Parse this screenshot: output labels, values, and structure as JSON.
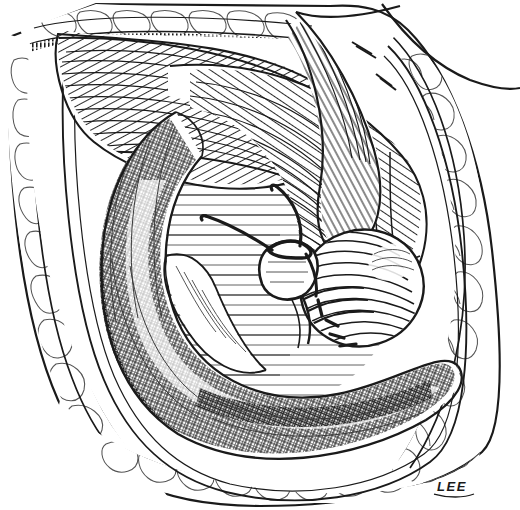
{
  "figure": {
    "medium": "pen-and-ink line drawing",
    "palette": {
      "background": "#ffffff",
      "ink": "#1a1a1a",
      "ink_soft": "#3a3a3a",
      "ink_light": "#555555"
    },
    "signature": "LEE",
    "canvas": {
      "width": 520,
      "height": 510
    }
  },
  "structures": [
    {
      "id": "skin-edge-left",
      "label": "Skin incision edge (left)",
      "description": "Outer curved skin margin of the laparotomy wound on the left side"
    },
    {
      "id": "skin-edge-right",
      "label": "Skin incision edge (right)",
      "description": "Outer curved skin margin of the laparotomy wound on the right side"
    },
    {
      "id": "subcutaneous-fat",
      "label": "Subcutaneous fat",
      "description": "Lobulated fatty layer rimming the wound on all sides, drawn as cobblestone lobules"
    },
    {
      "id": "fascia-edge",
      "label": "Cut fascial edge",
      "description": "Dense stippled band just inside the fat layer"
    },
    {
      "id": "oblique-muscle",
      "label": "Abdominal oblique muscle",
      "description": "Obliquely striated muscle belly sweeping across the upper field"
    },
    {
      "id": "transversus-muscle",
      "label": "Transversus abdominis fibers",
      "description": "Second muscle layer with fibers running at an angle beneath the oblique"
    },
    {
      "id": "retractor",
      "label": "Retractor blade",
      "description": "Smooth-surfaced metal retractor entering from upper right, holding the wound open"
    },
    {
      "id": "colon",
      "label": "Colon / ascending bowel",
      "description": "Large cross-hatched tubular bowel loop curving down the left and across the bottom"
    },
    {
      "id": "cecum",
      "label": "Cecum",
      "description": "Rounded sac at right of field drawn with concentric contour hatching"
    },
    {
      "id": "appendiceal-stump",
      "label": "Appendiceal stump",
      "description": "Short inverted stump held at the center by the suture"
    },
    {
      "id": "purse-string-suture",
      "label": "Purse-string suture",
      "description": "Heavy dark suture strands tied around the base of the stump, two free tails running up and to the left"
    },
    {
      "id": "mesoappendix",
      "label": "Mesoappendix / peritoneal fold",
      "description": "Thin membranous fold running from mid-field toward the lower left"
    },
    {
      "id": "peritoneum",
      "label": "Peritoneal surface",
      "description": "Horizontally hatched smooth serosal background filling the center of the wound"
    }
  ],
  "annotations": {
    "signature_position": "bottom-right",
    "signature_text": "LEE"
  }
}
